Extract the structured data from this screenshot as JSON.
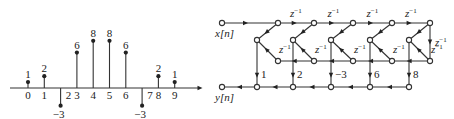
{
  "stem_plot": {
    "axis": {
      "x_start": 10,
      "x_end": 202,
      "y": 88
    },
    "origin_x": 28,
    "spacing": 16.3,
    "unit_px": 5.9,
    "samples": [
      {
        "n": 0,
        "n_label": "0",
        "value": 1,
        "value_label": "1"
      },
      {
        "n": 1,
        "n_label": "1",
        "value": 2,
        "value_label": "2"
      },
      {
        "n": 2,
        "n_label": "2",
        "value": -3,
        "value_label": "−3"
      },
      {
        "n": 3,
        "n_label": "3",
        "value": 6,
        "value_label": "6"
      },
      {
        "n": 4,
        "n_label": "4",
        "value": 8,
        "value_label": "8"
      },
      {
        "n": 5,
        "n_label": "5",
        "value": 8,
        "value_label": "8"
      },
      {
        "n": 6,
        "n_label": "6",
        "value": 6,
        "value_label": "6"
      },
      {
        "n": 7,
        "n_label": "7",
        "value": -3,
        "value_label": "−3"
      },
      {
        "n": 8,
        "n_label": "8",
        "value": 2,
        "value_label": "2"
      },
      {
        "n": 9,
        "n_label": "9",
        "value": 1,
        "value_label": "1"
      }
    ]
  },
  "flow_graph": {
    "input_label": "x[n]",
    "output_label": "y[n]",
    "delay_label": "z",
    "delay_exp": "−1",
    "rows": {
      "top": 23,
      "mid": 40,
      "low": 61,
      "bottom": 87
    },
    "input_x": 222,
    "output_x": 222,
    "top_nodes_x": [
      278,
      314,
      353,
      392,
      430
    ],
    "mid_nodes_x": [
      257,
      293,
      331,
      370,
      409
    ],
    "low_nodes_x": [
      278,
      314,
      353,
      392,
      430
    ],
    "bottom_nodes_x": [
      257,
      293,
      331,
      370,
      409
    ],
    "gains": [
      "1",
      "2",
      "−3",
      "6",
      "8"
    ]
  }
}
